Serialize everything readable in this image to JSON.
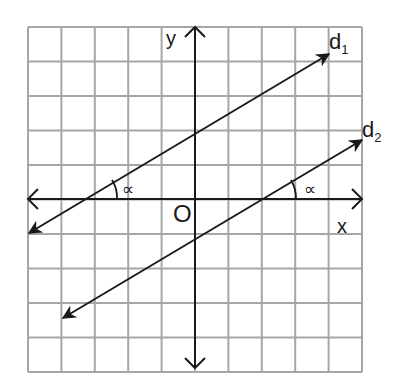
{
  "figure": {
    "type": "coordinate-geometry-diagram",
    "grid": {
      "columns": 10,
      "rows": 10,
      "color": "#a6a6a6"
    },
    "axes": {
      "x_label": "x",
      "y_label": "y",
      "origin_label": "O",
      "color": "#1a1a1a"
    },
    "lines": [
      {
        "name": "d",
        "subscript": "1",
        "x_intercept_units": -3.3,
        "y_intercept_units": 2.0,
        "slope": 0.6
      },
      {
        "name": "d",
        "subscript": "2",
        "x_intercept_units": 2.0,
        "y_intercept_units": -1.2,
        "slope": 0.6
      }
    ],
    "angle_label": "α",
    "angle_label_glyph": "∝"
  }
}
